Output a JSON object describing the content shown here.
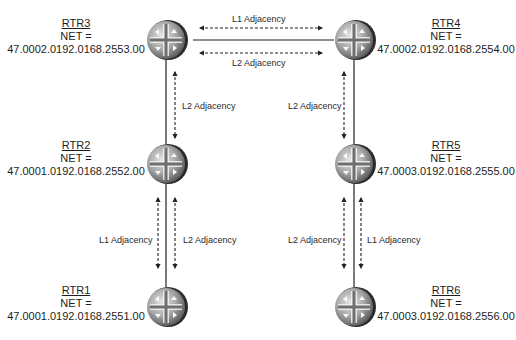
{
  "diagram": {
    "colors": {
      "background": "#ffffff",
      "link": "#222222",
      "arrow": "#222222",
      "router_dark": "#2b2b2b",
      "router_light": "#d9d9d9",
      "router_mid": "#8c8c8c",
      "text": "#1e1e1e"
    },
    "routers": [
      {
        "id": "rtr3",
        "name": "RTR3",
        "net_title": "NET =",
        "net": "47.0002.0192.0168.2553.00",
        "icon": "router-icon",
        "cx": 173,
        "cy": 40
      },
      {
        "id": "rtr4",
        "name": "RTR4",
        "net_title": "NET =",
        "net": "47.0002.0192.0168.2554.00",
        "icon": "router-icon",
        "cx": 354,
        "cy": 40
      },
      {
        "id": "rtr2",
        "name": "RTR2",
        "net_title": "NET =",
        "net": "47.0001.0192.0168.2552.00",
        "icon": "router-icon",
        "cx": 173,
        "cy": 164
      },
      {
        "id": "rtr5",
        "name": "RTR5",
        "net_title": "NET =",
        "net": "47.0003.0192.0168.2555.00",
        "icon": "router-icon",
        "cx": 354,
        "cy": 164
      },
      {
        "id": "rtr1",
        "name": "RTR1",
        "net_title": "NET =",
        "net": "47.0001.0192.0168.2551.00",
        "icon": "router-icon",
        "cx": 173,
        "cy": 307
      },
      {
        "id": "rtr6",
        "name": "RTR6",
        "net_title": "NET =",
        "net": "47.0003.0192.0168.2556.00",
        "icon": "router-icon",
        "cx": 354,
        "cy": 307
      }
    ],
    "links": [
      {
        "from": "RTR3",
        "to": "RTR4"
      },
      {
        "from": "RTR3",
        "to": "RTR2"
      },
      {
        "from": "RTR4",
        "to": "RTR5"
      },
      {
        "from": "RTR2",
        "to": "RTR1"
      },
      {
        "from": "RTR5",
        "to": "RTR6"
      }
    ],
    "adjacencies": [
      {
        "between": [
          "RTR3",
          "RTR4"
        ],
        "label": "L1 Adjacency"
      },
      {
        "between": [
          "RTR3",
          "RTR4"
        ],
        "label": "L2 Adjacency"
      },
      {
        "between": [
          "RTR3",
          "RTR2"
        ],
        "label": "L2 Adjacency"
      },
      {
        "between": [
          "RTR4",
          "RTR5"
        ],
        "label": "L2 Adjacency"
      },
      {
        "between": [
          "RTR2",
          "RTR1"
        ],
        "label": "L1 Adjacency"
      },
      {
        "between": [
          "RTR2",
          "RTR1"
        ],
        "label": "L2 Adjacency"
      },
      {
        "between": [
          "RTR5",
          "RTR6"
        ],
        "label": "L2 Adjacency"
      },
      {
        "between": [
          "RTR5",
          "RTR6"
        ],
        "label": "L1 Adjacency"
      }
    ]
  }
}
